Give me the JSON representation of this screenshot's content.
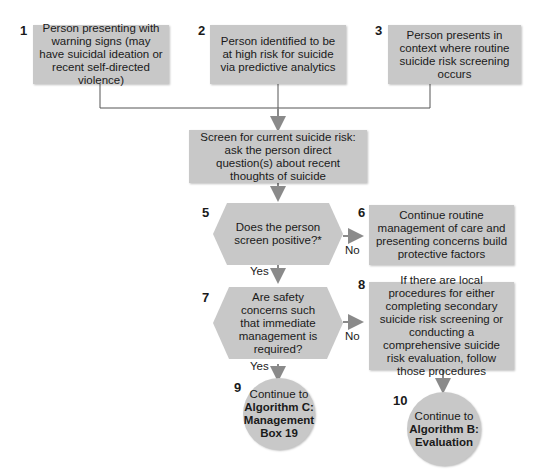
{
  "nodes": {
    "n1": {
      "num": "1",
      "text": "Person presenting with warning signs (may have suicidal ideation or recent self-directed violence)"
    },
    "n2": {
      "num": "2",
      "text": "Person identified to be at high risk for suicide via predictive analytics"
    },
    "n3": {
      "num": "3",
      "text": "Person presents in context where routine suicide risk screening occurs"
    },
    "n4": {
      "num": "4",
      "text": "Screen for current suicide risk: ask the person direct question(s) about recent thoughts of suicide"
    },
    "n5": {
      "num": "5",
      "text": "Does the person screen positive?*"
    },
    "n6": {
      "num": "6",
      "text": "Continue routine management of care and presenting concerns build protective factors"
    },
    "n7": {
      "num": "7",
      "text": "Are safety concerns such that immediate management is required?"
    },
    "n8": {
      "num": "8",
      "text": "If there are local procedures for either completing secondary suicide risk screening or conducting a comprehensive suicide risk evaluation, follow those procedures"
    },
    "n9": {
      "num": "9",
      "line1": "Continue to",
      "line2": "Algorithm C:",
      "line3": "Management",
      "line4": "Box 19"
    },
    "n10": {
      "num": "10",
      "line1": "Continue to",
      "line2": "Algorithm B:",
      "line3": "Evaluation"
    }
  },
  "edges": {
    "n5_no": "No",
    "n5_yes": "Yes",
    "n7_no": "No",
    "n7_yes": "Yes"
  },
  "colors": {
    "fill": "#c8c8c8",
    "line": "#555555",
    "arrow": "#8a8a8a"
  }
}
